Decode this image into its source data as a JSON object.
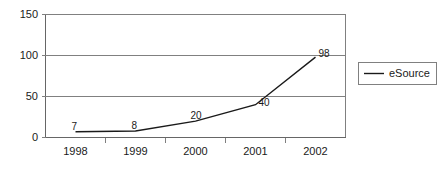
{
  "chart_data": {
    "type": "line",
    "title": "",
    "subtitle": "",
    "xlabel": "",
    "ylabel": "",
    "categories": [
      "1998",
      "1999",
      "2000",
      "2001",
      "2002"
    ],
    "series": [
      {
        "name": "eSource",
        "values": [
          7,
          8,
          20,
          40,
          98
        ],
        "color": "#1a1a1a",
        "point_labels": [
          "7",
          "8",
          "20",
          "40",
          "98"
        ]
      }
    ],
    "ylim": [
      0,
      150
    ],
    "y_ticks": [
      0,
      50,
      100,
      150
    ],
    "y_tick_labels": [
      "0",
      "50",
      "100",
      "150"
    ],
    "x_tick_labels": [
      "1998",
      "1999",
      "2000",
      "2001",
      "2002"
    ],
    "grid": true,
    "grid_axis": "y",
    "legend": {
      "position": "right",
      "entries": [
        {
          "label": "eSource",
          "color": "#1a1a1a",
          "marker": "line"
        }
      ]
    },
    "background_color": "#ffffff",
    "axis_color": "#808080",
    "text_color": "#1a1a1a"
  },
  "axes": {
    "y_labels": {
      "t0": "0",
      "t1": "50",
      "t2": "100",
      "t3": "150"
    },
    "x_labels": {
      "c0": "1998",
      "c1": "1999",
      "c2": "2000",
      "c3": "2001",
      "c4": "2002"
    }
  },
  "data_labels": {
    "p0": "7",
    "p1": "8",
    "p2": "20",
    "p3": "40",
    "p4": "98"
  },
  "legend": {
    "series_1_label": "eSource"
  }
}
